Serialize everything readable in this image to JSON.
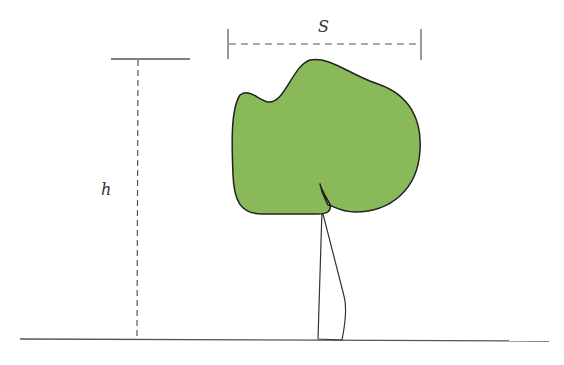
{
  "diagram": {
    "title": "",
    "labels": {
      "crown_width": "S",
      "tree_height": "h"
    },
    "colors": {
      "canopy_fill": "#8ab95a",
      "outline": "#222222",
      "dimension_line": "#555555",
      "ground_line": "#555555"
    },
    "elements": [
      {
        "name": "ground-line",
        "type": "solid-line"
      },
      {
        "name": "height-dimension",
        "type": "dashed-line",
        "label": "h"
      },
      {
        "name": "height-top-marker",
        "type": "solid-line"
      },
      {
        "name": "crown-width-dimension",
        "type": "dashed-line",
        "label": "S"
      },
      {
        "name": "tree-canopy",
        "type": "shape"
      },
      {
        "name": "tree-trunk",
        "type": "shape"
      }
    ]
  }
}
